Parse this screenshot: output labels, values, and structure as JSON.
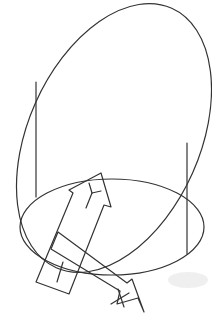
{
  "diagram": {
    "type": "3d-coordinate-frame-sketch",
    "stroke_color": "#333333",
    "background": "#ffffff",
    "shapes": [
      {
        "id": "tilted-ellipse",
        "kind": "ellipse"
      },
      {
        "id": "base-ellipse",
        "kind": "ellipse"
      },
      {
        "id": "left-vertical-line",
        "kind": "line"
      },
      {
        "id": "right-vertical-line",
        "kind": "line"
      },
      {
        "id": "y-axis-arrow",
        "kind": "arrow",
        "label": "Y"
      },
      {
        "id": "x-axis-arrow",
        "kind": "arrow",
        "label": "X"
      }
    ],
    "labels": {
      "y_arrow": "Y",
      "x_arrow": "X"
    },
    "caption": "... "
  }
}
